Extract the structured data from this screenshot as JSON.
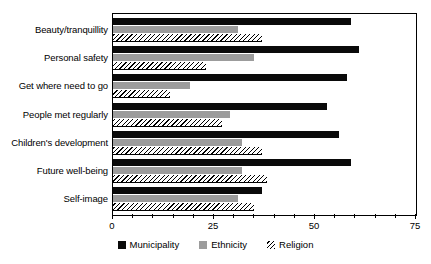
{
  "chart_data": {
    "type": "bar",
    "orientation": "horizontal",
    "title": "",
    "xlabel": "",
    "ylabel": "",
    "xlim": [
      0,
      75
    ],
    "xticks": [
      0,
      25,
      50,
      75
    ],
    "xtick_labels": [
      "0",
      "25",
      "50",
      "75"
    ],
    "minor_ticks_per_interval": 5,
    "grid": false,
    "legend_position": "bottom-center",
    "categories": [
      "Beauty/tranquillity",
      "Personal safety",
      "Get where need to go",
      "People met regularly",
      "Children's development",
      "Future well-being",
      "Self-image"
    ],
    "series": [
      {
        "name": "Municipality",
        "color": "#0a0a0a",
        "pattern": "solid",
        "values": [
          59,
          61,
          58,
          53,
          56,
          59,
          37
        ]
      },
      {
        "name": "Ethnicity",
        "color": "#9c9c9c",
        "pattern": "solid",
        "values": [
          31,
          35,
          19,
          29,
          32,
          32,
          31
        ]
      },
      {
        "name": "Religion",
        "color": "#ffffff",
        "pattern": "diagonal-hatch",
        "values": [
          37,
          23,
          14,
          27,
          37,
          38,
          35
        ]
      }
    ]
  },
  "legend": {
    "items": [
      {
        "label": "Municipality",
        "swatch": "solid-black-swatch"
      },
      {
        "label": "Ethnicity",
        "swatch": "solid-gray-swatch"
      },
      {
        "label": "Religion",
        "swatch": "hatched-swatch"
      }
    ]
  },
  "colors": {
    "municipality": "#0a0a0a",
    "ethnicity": "#9c9c9c",
    "religion_line": "#000000",
    "axis": "#000000",
    "background": "#ffffff"
  }
}
